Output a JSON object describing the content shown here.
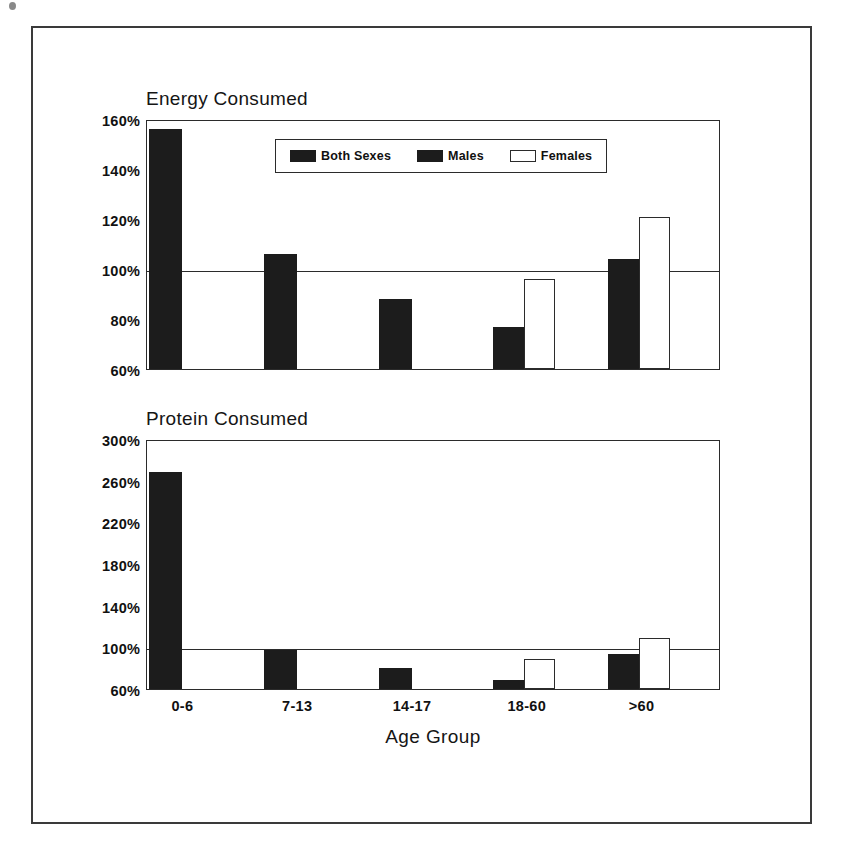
{
  "figure": {
    "x_axis_label": "Age Group",
    "legend": [
      {
        "label": "Both Sexes",
        "swatch": "filled-square-icon",
        "style": "filled"
      },
      {
        "label": "Males",
        "swatch": "filled-square-icon",
        "style": "filled"
      },
      {
        "label": "Females",
        "swatch": "open-square-icon",
        "style": "open"
      }
    ]
  },
  "chart_data": [
    {
      "id": "energy",
      "type": "bar",
      "title": "Energy Consumed",
      "xlabel": "Age Group",
      "ylabel": "",
      "ylim": [
        60,
        160
      ],
      "yticks": [
        60,
        80,
        100,
        120,
        140,
        160
      ],
      "ytick_labels": [
        "60%",
        "80%",
        "100%",
        "120%",
        "140%",
        "160%"
      ],
      "grid": false,
      "reference_line": 100,
      "legend_position": "inside-top-center",
      "categories": [
        "0-6",
        "7-13",
        "14-17",
        "18-60",
        ">60"
      ],
      "series": [
        {
          "name": "Both Sexes",
          "style": "filled",
          "values": [
            156,
            106,
            88,
            null,
            null
          ]
        },
        {
          "name": "Males",
          "style": "filled",
          "values": [
            null,
            null,
            null,
            77,
            104
          ]
        },
        {
          "name": "Females",
          "style": "open",
          "values": [
            null,
            null,
            null,
            96,
            121
          ]
        }
      ]
    },
    {
      "id": "protein",
      "type": "bar",
      "title": "Protein Consumed",
      "xlabel": "Age Group",
      "ylabel": "",
      "ylim": [
        60,
        300
      ],
      "yticks": [
        60,
        100,
        140,
        180,
        220,
        260,
        300
      ],
      "ytick_labels": [
        "60%",
        "100%",
        "140%",
        "180%",
        "220%",
        "260%",
        "300%"
      ],
      "grid": false,
      "reference_line": 100,
      "legend_position": "none",
      "categories": [
        "0-6",
        "7-13",
        "14-17",
        "18-60",
        ">60"
      ],
      "series": [
        {
          "name": "Both Sexes",
          "style": "filled",
          "values": [
            268,
            97,
            80,
            null,
            null
          ]
        },
        {
          "name": "Males",
          "style": "filled",
          "values": [
            null,
            null,
            null,
            69,
            94
          ]
        },
        {
          "name": "Females",
          "style": "open",
          "values": [
            null,
            null,
            null,
            89,
            109
          ]
        }
      ]
    }
  ]
}
